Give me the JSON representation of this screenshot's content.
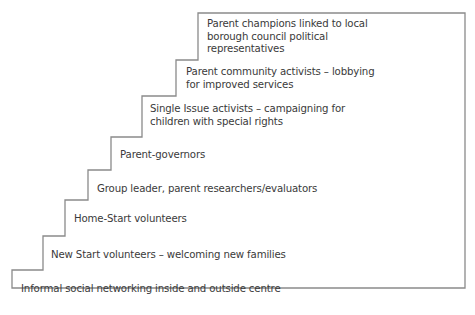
{
  "diagram": {
    "type": "staircase",
    "line_color": "#8a8a8a",
    "text_color": "#3a3a3a",
    "steps": [
      {
        "level": 1,
        "lines": [
          "Informal social networking inside and outside centre"
        ]
      },
      {
        "level": 2,
        "lines": [
          "New Start volunteers – welcoming new families"
        ]
      },
      {
        "level": 3,
        "lines": [
          "Home-Start volunteers"
        ]
      },
      {
        "level": 4,
        "lines": [
          "Group leader, parent researchers/evaluators"
        ]
      },
      {
        "level": 5,
        "lines": [
          "Parent-governors"
        ]
      },
      {
        "level": 6,
        "lines": [
          "Single Issue activists – campaigning for",
          "children with special rights"
        ]
      },
      {
        "level": 7,
        "lines": [
          "Parent community activists – lobbying",
          "for improved services"
        ]
      },
      {
        "level": 8,
        "lines": [
          "Parent champions linked to local",
          "borough council political",
          "representatives"
        ]
      }
    ]
  }
}
